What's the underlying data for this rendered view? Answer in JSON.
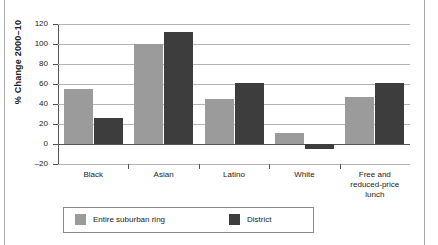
{
  "chart_data": {
    "type": "bar",
    "title": "",
    "subtitle": "",
    "xlabel": "",
    "ylabel": "% Change 2000–10",
    "ylim": [
      -20,
      120
    ],
    "yticks": [
      120,
      100,
      80,
      60,
      40,
      20,
      0,
      -20
    ],
    "ytick_labels": [
      "120",
      "100",
      "80",
      "60",
      "40",
      "20",
      "0",
      "–20"
    ],
    "grid": true,
    "legend_position": "bottom",
    "categories": [
      "Black",
      "Asian",
      "Latino",
      "White",
      "Free and reduced-price lunch"
    ],
    "category_lines": [
      [
        "Black"
      ],
      [
        "Asian"
      ],
      [
        "Latino"
      ],
      [
        "White"
      ],
      [
        "Free and",
        "reduced-price",
        "lunch"
      ]
    ],
    "series": [
      {
        "name": "Entire suburban ring",
        "color": "#9b9b9b",
        "values": [
          55,
          100,
          45,
          11,
          47
        ]
      },
      {
        "name": "District",
        "color": "#3d3d3d",
        "values": [
          26,
          112,
          61,
          -5,
          61
        ]
      }
    ]
  },
  "legend": {
    "entries": [
      {
        "label": "Entire suburban ring",
        "color": "#9b9b9b"
      },
      {
        "label": "District",
        "color": "#3d3d3d"
      }
    ]
  },
  "colors": {
    "light_gray_bar": "#9b9b9b",
    "dark_gray_bar": "#3d3d3d",
    "gridline": "#b4b4b4",
    "axis": "#555555",
    "page_rule": "#a8a8a8",
    "text": "#1a1a1a"
  }
}
